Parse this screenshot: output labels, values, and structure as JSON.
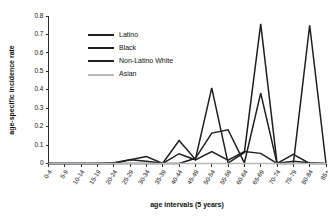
{
  "chart_data": {
    "type": "line",
    "title": "",
    "xlabel": "age intervals (5 years)",
    "ylabel": "age-specific incidence rate",
    "grid": false,
    "legend_position": "upper-left-inside",
    "ylim": [
      0,
      0.8
    ],
    "ytick_labels": [
      "0",
      "0.1",
      "0.2",
      "0.3",
      "0.4",
      "0.5",
      "0.6",
      "0.7",
      "0.8"
    ],
    "ytick_values": [
      0,
      0.1,
      0.2,
      0.3,
      0.4,
      0.5,
      0.6,
      0.7,
      0.8
    ],
    "categories": [
      "0-4",
      "5-9",
      "10-14",
      "15-19",
      "20-24",
      "25-29",
      "30-34",
      "35-39",
      "40-44",
      "45-49",
      "50-54",
      "55-59",
      "60-64",
      "65-69",
      "70-74",
      "75-79",
      "80-84",
      "85+"
    ],
    "series": [
      {
        "name": "Latino",
        "color": "#1f1f1f",
        "width": 1.5,
        "values": [
          0,
          0,
          0,
          0,
          0,
          0.02,
          0.038,
          0,
          0.053,
          0.02,
          0.065,
          0.018,
          0.065,
          0.055,
          0,
          0.05,
          0,
          0
        ]
      },
      {
        "name": "Black",
        "color": "#1f1f1f",
        "width": 1.5,
        "values": [
          0,
          0,
          0,
          0,
          0,
          0,
          0,
          0,
          0,
          0.028,
          0.165,
          0.183,
          0.003,
          0.382,
          0,
          0,
          0.75,
          0
        ]
      },
      {
        "name": "Non-Latino White",
        "color": "#1f1f1f",
        "width": 1.5,
        "values": [
          0,
          0,
          0,
          0,
          0.004,
          0.02,
          0.012,
          0.002,
          0.125,
          0.022,
          0.41,
          0.002,
          0.06,
          0.757,
          0.002,
          0.012,
          0.004,
          0
        ]
      },
      {
        "name": "Asian",
        "color": "#b9b9b9",
        "width": 1.4,
        "values": [
          0,
          0,
          0,
          0,
          0,
          0,
          0,
          0,
          0,
          0,
          0,
          0,
          0,
          0,
          0,
          0,
          0,
          0
        ]
      }
    ]
  },
  "legend": {
    "entries": [
      {
        "label": "Latino",
        "color": "#1f1f1f"
      },
      {
        "label": "Black",
        "color": "#1f1f1f"
      },
      {
        "label": "Non-Latino White",
        "color": "#1f1f1f"
      },
      {
        "label": "Asian",
        "color": "#b9b9b9"
      }
    ]
  }
}
